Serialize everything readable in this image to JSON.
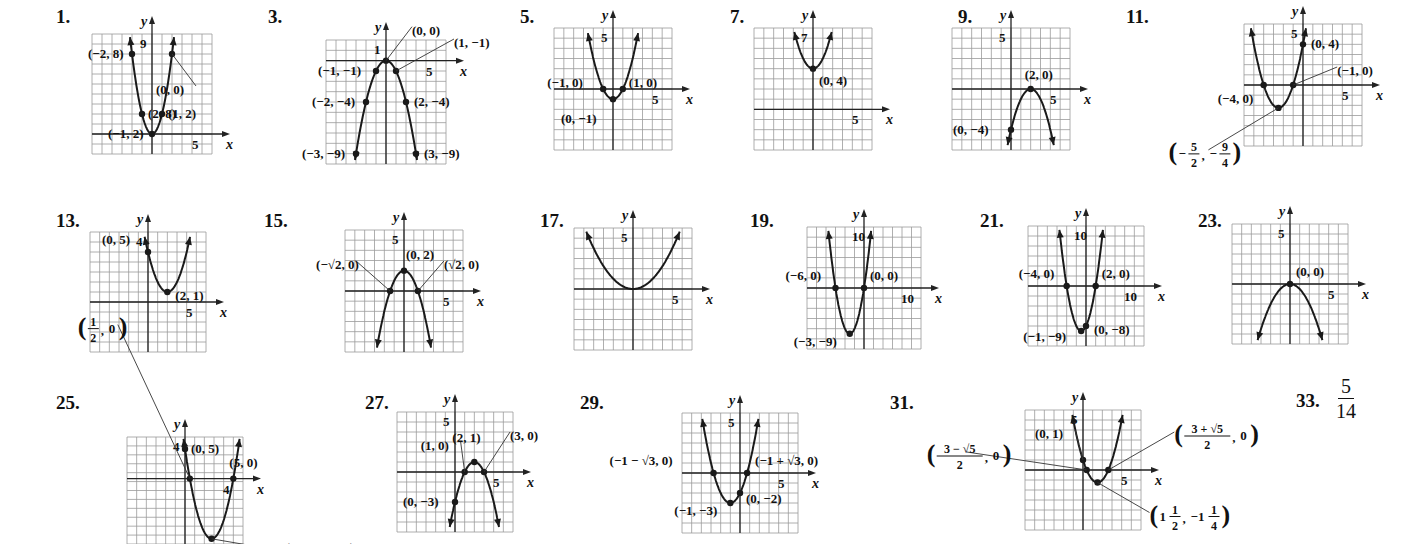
{
  "colors": {
    "grid": "#9a9a9a",
    "axis": "#222222",
    "curve": "#1a1a1a",
    "text": "#111111"
  },
  "chart_data": [
    {
      "id": "1",
      "type": "line",
      "title": "1.",
      "function": "y = 2x^2",
      "xlim": [
        -6,
        6
      ],
      "ylim": [
        -2,
        10
      ],
      "x_tick_label": "5",
      "y_tick_label": "9",
      "points": [
        [
          "(-2, 8)",
          -2,
          8
        ],
        [
          "(-1, 2)",
          -1,
          2
        ],
        [
          "(0, 0)",
          0,
          0
        ],
        [
          "(1, 2)",
          1,
          2
        ],
        [
          "(2, 8)",
          2,
          8
        ]
      ]
    },
    {
      "id": "3",
      "type": "line",
      "title": "3.",
      "function": "y = -x^2",
      "xlim": [
        -6,
        6
      ],
      "ylim": [
        -10,
        2
      ],
      "x_tick_label": "5",
      "y_tick_label": "1",
      "points": [
        [
          "(0, 0)",
          0,
          0
        ],
        [
          "(1, -1)",
          1,
          -1
        ],
        [
          "(-1, -1)",
          -1,
          -1
        ],
        [
          "(-2, -4)",
          -2,
          -4
        ],
        [
          "(2, -4)",
          2,
          -4
        ],
        [
          "(-3, -9)",
          -3,
          -9
        ],
        [
          "(3, -9)",
          3,
          -9
        ]
      ]
    },
    {
      "id": "5",
      "type": "line",
      "title": "5.",
      "function": "y = x^2 - 1",
      "xlim": [
        -6,
        6
      ],
      "ylim": [
        -6,
        6
      ],
      "x_tick_label": "5",
      "y_tick_label": "5",
      "points": [
        [
          "(-1, 0)",
          -1,
          0
        ],
        [
          "(1, 0)",
          1,
          0
        ],
        [
          "(0, -1)",
          0,
          -1
        ]
      ]
    },
    {
      "id": "7",
      "type": "line",
      "title": "7.",
      "function": "y = x^2 + 4",
      "xlim": [
        -6,
        6
      ],
      "ylim": [
        -4,
        8
      ],
      "x_tick_label": "5",
      "y_tick_label": "7",
      "points": [
        [
          "(0, 4)",
          0,
          4
        ]
      ]
    },
    {
      "id": "9",
      "type": "line",
      "title": "9.",
      "function": "y = -(x - 2)^2",
      "xlim": [
        -6,
        6
      ],
      "ylim": [
        -6,
        6
      ],
      "x_tick_label": "5",
      "y_tick_label": "5",
      "points": [
        [
          "(2, 0)",
          2,
          0
        ],
        [
          "(0, -4)",
          0,
          -4
        ]
      ]
    },
    {
      "id": "11",
      "type": "line",
      "title": "11.",
      "function": "y = x^2 + 5x + 4",
      "xlim": [
        -6,
        6
      ],
      "ylim": [
        -6,
        6
      ],
      "x_tick_label": "5",
      "y_tick_label": "5",
      "points": [
        [
          "(0, 4)",
          0,
          4
        ],
        [
          "(-1, 0)",
          -1,
          0
        ],
        [
          "(-4, 0)",
          -4,
          0
        ],
        [
          "(-5/2, -9/4)",
          -2.5,
          -2.25
        ]
      ]
    },
    {
      "id": "13",
      "type": "line",
      "title": "13.",
      "function": "y = (x - 2)^2 + 1",
      "xlim": [
        -6,
        6
      ],
      "ylim": [
        -5,
        7
      ],
      "x_tick_label": "5",
      "y_tick_label": "4",
      "points": [
        [
          "(0, 5)",
          0,
          5
        ],
        [
          "(2, 1)",
          2,
          1
        ]
      ]
    },
    {
      "id": "15",
      "type": "line",
      "title": "15.",
      "function": "y = -x^2 + 2",
      "xlim": [
        -6,
        6
      ],
      "ylim": [
        -6,
        6
      ],
      "x_tick_label": "5",
      "y_tick_label": "5",
      "points": [
        [
          "(0, 2)",
          0,
          2
        ],
        [
          "(-√2, 0)",
          -1.414,
          0
        ],
        [
          "(√2, 0)",
          1.414,
          0
        ]
      ]
    },
    {
      "id": "17",
      "type": "line",
      "title": "17.",
      "function": "y = 0.25x^2",
      "xlim": [
        -6,
        6
      ],
      "ylim": [
        -6,
        6
      ],
      "x_tick_label": "5",
      "y_tick_label": "5",
      "points": []
    },
    {
      "id": "19",
      "type": "line",
      "title": "19.",
      "function": "y = x^2 + 6x",
      "xlim": [
        -12,
        12
      ],
      "ylim": [
        -12,
        12
      ],
      "x_tick_label": "10",
      "y_tick_label": "10",
      "points": [
        [
          "(-6, 0)",
          -6,
          0
        ],
        [
          "(0, 0)",
          0,
          0
        ],
        [
          "(-3, -9)",
          -3,
          -9
        ]
      ]
    },
    {
      "id": "21",
      "type": "line",
      "title": "21.",
      "function": "y = x^2 + 2x - 8",
      "xlim": [
        -12,
        12
      ],
      "ylim": [
        -12,
        12
      ],
      "x_tick_label": "10",
      "y_tick_label": "10",
      "points": [
        [
          "(-4, 0)",
          -4,
          0
        ],
        [
          "(2, 0)",
          2,
          0
        ],
        [
          "(-1, -9)",
          -1,
          -9
        ],
        [
          "(0, -8)",
          0,
          -8
        ]
      ]
    },
    {
      "id": "23",
      "type": "line",
      "title": "23.",
      "function": "y = -0.5x^2",
      "xlim": [
        -6,
        6
      ],
      "ylim": [
        -6,
        6
      ],
      "x_tick_label": "5",
      "y_tick_label": "5",
      "points": [
        [
          "(0, 0)",
          0,
          0
        ]
      ]
    },
    {
      "id": "25",
      "type": "line",
      "title": "25.",
      "function": "y = 2x^2 - 11x + 5",
      "xlim": [
        -6,
        6
      ],
      "ylim": [
        -11,
        7
      ],
      "x_tick_label": "4",
      "y_tick_label": "4",
      "points": [
        [
          "(1/2, 0)",
          0.5,
          0
        ],
        [
          "(0, 5)",
          0,
          5
        ],
        [
          "(5, 0)",
          5,
          0
        ],
        [
          "(11/4, -81/8)",
          2.75,
          -10.125
        ]
      ]
    },
    {
      "id": "27",
      "type": "line",
      "title": "27.",
      "function": "y = -x^2 + 4x - 3",
      "xlim": [
        -6,
        6
      ],
      "ylim": [
        -6,
        6
      ],
      "x_tick_label": "5",
      "y_tick_label": "5",
      "points": [
        [
          "(1, 0)",
          1,
          0
        ],
        [
          "(2, 1)",
          2,
          1
        ],
        [
          "(3, 0)",
          3,
          0
        ],
        [
          "(0, -3)",
          0,
          -3
        ]
      ]
    },
    {
      "id": "29",
      "type": "line",
      "title": "29.",
      "function": "y = x^2 + 2x - 2",
      "xlim": [
        -6,
        6
      ],
      "ylim": [
        -6,
        6
      ],
      "x_tick_label": "5",
      "y_tick_label": "5",
      "points": [
        [
          "(-1 - √3, 0)",
          -2.732,
          0
        ],
        [
          "(-1 + √3, 0)",
          0.732,
          0
        ],
        [
          "(-1, -3)",
          -1,
          -3
        ],
        [
          "(0, -2)",
          0,
          -2
        ]
      ]
    },
    {
      "id": "31",
      "type": "line",
      "title": "31.",
      "function": "y = x^2 - 3x + 1",
      "xlim": [
        -6,
        6
      ],
      "ylim": [
        -6,
        6
      ],
      "x_tick_label": "5",
      "y_tick_label": "5",
      "points": [
        [
          "(0, 1)",
          0,
          1
        ],
        [
          "((3 - √5)/2, 0)",
          0.382,
          0
        ],
        [
          "((3 + √5)/2, 0)",
          2.618,
          0
        ],
        [
          "(1 1/2, -1 1/4)",
          1.5,
          -1.25
        ]
      ]
    }
  ],
  "answer_33": {
    "label": "33.",
    "numerator": "5",
    "denominator": "14"
  },
  "layout": [
    {
      "id": "1",
      "num": "1.",
      "nx": 56,
      "ny": 6,
      "gx": 92,
      "gy": 34,
      "w": 120,
      "h": 120,
      "a": [
        2.3,
        2.3,
        "A",
        0,
        0,
        1,
        0
      ]
    },
    {
      "id": "3",
      "num": "3.",
      "nx": 268,
      "ny": 6,
      "gx": 326,
      "gy": 40,
      "w": 120,
      "h": 124,
      "a": [
        -1,
        0,
        "A",
        0,
        0,
        1,
        0
      ]
    },
    {
      "id": "5",
      "num": "5.",
      "nx": 520,
      "ny": 6,
      "gx": 554,
      "gy": 28,
      "w": 118,
      "h": 122
    },
    {
      "id": "7",
      "num": "7.",
      "nx": 730,
      "ny": 6,
      "gx": 754,
      "gy": 28,
      "w": 118,
      "h": 122
    },
    {
      "id": "9",
      "num": "9.",
      "nx": 958,
      "ny": 6,
      "gx": 952,
      "gy": 28,
      "w": 118,
      "h": 122
    },
    {
      "id": "11",
      "num": "11.",
      "nx": 1126,
      "ny": 6,
      "gx": 1244,
      "gy": 24,
      "w": 118,
      "h": 122
    },
    {
      "id": "13",
      "num": "13.",
      "nx": 56,
      "ny": 210,
      "gx": 90,
      "gy": 232,
      "w": 116,
      "h": 120
    },
    {
      "id": "15",
      "num": "15.",
      "nx": 264,
      "ny": 210,
      "gx": 345,
      "gy": 230,
      "w": 118,
      "h": 122
    },
    {
      "id": "17",
      "num": "17.",
      "nx": 540,
      "ny": 210,
      "gx": 574,
      "gy": 228,
      "w": 118,
      "h": 122
    },
    {
      "id": "19",
      "num": "19.",
      "nx": 750,
      "ny": 210,
      "gx": 807,
      "gy": 227,
      "w": 114,
      "h": 122
    },
    {
      "id": "21",
      "num": "21.",
      "nx": 980,
      "ny": 210,
      "gx": 1028,
      "gy": 226,
      "w": 116,
      "h": 120
    },
    {
      "id": "23",
      "num": "23.",
      "nx": 1198,
      "ny": 210,
      "gx": 1232,
      "gy": 224,
      "w": 116,
      "h": 120
    },
    {
      "id": "25",
      "num": "25.",
      "nx": 56,
      "ny": 392,
      "gx": 127,
      "gy": 437,
      "w": 116,
      "h": 107
    },
    {
      "id": "27",
      "num": "27.",
      "nx": 365,
      "ny": 392,
      "gx": 397,
      "gy": 412,
      "w": 116,
      "h": 120
    },
    {
      "id": "29",
      "num": "29.",
      "nx": 580,
      "ny": 392,
      "gx": 682,
      "gy": 413,
      "w": 116,
      "h": 120
    },
    {
      "id": "31",
      "num": "31.",
      "nx": 890,
      "ny": 392,
      "gx": 1025,
      "gy": 410,
      "w": 116,
      "h": 120
    }
  ],
  "labels": {
    "1": [
      [
        "(−2, 8)",
        -44,
        0
      ],
      [
        "(2, 8)",
        6,
        0
      ],
      [
        "(−1, 2)",
        -44,
        0
      ],
      [
        "(1, 2)",
        6,
        0
      ],
      [
        "(0, 0)",
        -16,
        36,
        "lead"
      ]
    ],
    "3": [
      [
        "(0, 0)",
        26,
        -30,
        "lead"
      ],
      [
        "(1, −1)",
        58,
        -28,
        "lead"
      ],
      [
        "(−1, −1)",
        -58,
        0
      ],
      [
        "(−2, −4)",
        -54,
        0
      ],
      [
        "(2, −4)",
        8,
        0
      ],
      [
        "(−3, −9)",
        -54,
        0
      ],
      [
        "(3, −9)",
        8,
        0
      ]
    ],
    "5": [
      [
        "(−1, 0)",
        -56,
        -6
      ],
      [
        "(1, 0)",
        6,
        -6
      ],
      [
        "(0, −1)",
        -52,
        20
      ]
    ],
    "7": [
      [
        "(0, 4)",
        6,
        12
      ]
    ],
    "9": [
      [
        "(2, 0)",
        -6,
        -14
      ],
      [
        "(0, −4)",
        -58,
        0
      ]
    ],
    "11": [
      [
        "(0, 4)",
        8,
        0
      ],
      [
        "(−1, 0)",
        44,
        -14,
        "lead"
      ],
      [
        "(−4, 0)",
        -46,
        14
      ],
      [
        "frac:−5/2,−9/4",
        -110,
        46,
        "lead"
      ]
    ],
    "13": [
      [
        "(0, 5)",
        -46,
        -12
      ],
      [
        "(2, 1)",
        8,
        4
      ]
    ],
    "15": [
      [
        "(0, 2)",
        2,
        -16
      ],
      [
        "(−√2, 0)",
        -74,
        -26,
        "lead"
      ],
      [
        "(√2, 0)",
        26,
        -26,
        "lead"
      ]
    ],
    "19": [
      [
        "(−6, 0)",
        -50,
        -12
      ],
      [
        "(0, 0)",
        6,
        -12
      ],
      [
        "(−3, −9)",
        -56,
        8
      ]
    ],
    "21": [
      [
        "(−4, 0)",
        -48,
        -12
      ],
      [
        "(2, 0)",
        6,
        -12
      ],
      [
        "(−1, −9)",
        -58,
        6
      ],
      [
        "(0, −8)",
        8,
        4
      ]
    ],
    "23": [
      [
        "(0, 0)",
        6,
        -12
      ]
    ],
    "25": [
      [
        "frac:1/2,0",
        -112,
        -150,
        "lead"
      ],
      [
        "(0, 5)",
        6,
        0
      ],
      [
        "(5, 0)",
        -4,
        -16
      ],
      [
        "frac:11/4,−81/8",
        70,
        16,
        "lead"
      ]
    ],
    "27": [
      [
        "(1, 0)",
        -44,
        -26,
        "lead"
      ],
      [
        "(2, 1)",
        -22,
        -24
      ],
      [
        "(3, 0)",
        26,
        -36,
        "lead"
      ],
      [
        "(0, −3)",
        -52,
        0
      ]
    ],
    "29": [
      [
        "(−1 − √3, 0)",
        -104,
        -12
      ],
      [
        "(−1 + √3, 0)",
        8,
        -12
      ],
      [
        "(−1, −3)",
        -56,
        8
      ],
      [
        "(0, −2)",
        6,
        6
      ]
    ],
    "31": [
      [
        "(0, 1)",
        -48,
        -26,
        "lead"
      ],
      [
        "frac:3 − √5/2,0",
        -160,
        -14,
        "lead"
      ],
      [
        "frac:3 + √5/2,0",
        66,
        -34,
        "lead"
      ],
      [
        "frac:1 1/2,−1 1/4",
        52,
        34,
        "lead"
      ]
    ]
  }
}
